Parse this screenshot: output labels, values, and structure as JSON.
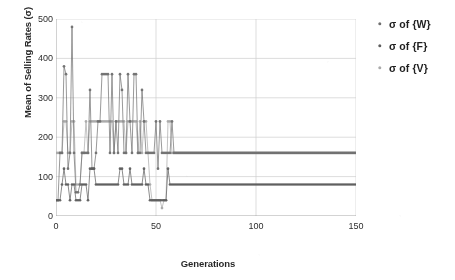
{
  "chart_data": {
    "type": "line",
    "title": "",
    "xlabel": "Generations",
    "ylabel": "Mean of Selling Rates (σ)",
    "xlim": [
      0,
      150
    ],
    "ylim": [
      0,
      500
    ],
    "xticks": [
      0,
      50,
      100,
      150
    ],
    "yticks": [
      0,
      100,
      200,
      300,
      400,
      500
    ],
    "grid": true,
    "legend_position": "right",
    "legend": [
      "σ of {W}",
      "σ of {F}",
      "σ of {V}"
    ],
    "colors": {
      "series_W": "#6b6b6b",
      "series_F": "#585858",
      "series_V": "#a8a8a8",
      "axis": "#9a9a9a",
      "grid": "#cfcfcf",
      "text": "#1c1c1c"
    },
    "annotations": [
      "All three series oscillate sharply for the first ~58 generations, then converge to constant plateaus.",
      "Converged upper plateau ≈ 160",
      "Converged lower plateau ≈ 80",
      "Global maximum ≈ 480 at generation 8"
    ],
    "x": [
      0,
      1,
      2,
      3,
      4,
      5,
      6,
      7,
      8,
      9,
      10,
      11,
      12,
      13,
      14,
      15,
      16,
      17,
      18,
      19,
      20,
      21,
      22,
      23,
      24,
      25,
      26,
      27,
      28,
      29,
      30,
      31,
      32,
      33,
      34,
      35,
      36,
      37,
      38,
      39,
      40,
      41,
      42,
      43,
      44,
      45,
      46,
      47,
      48,
      49,
      50,
      51,
      52,
      53,
      54,
      55,
      56,
      57,
      58,
      59,
      60,
      65,
      70,
      75,
      80,
      85,
      90,
      95,
      100,
      105,
      110,
      115,
      120,
      125,
      130,
      135,
      140,
      145,
      150
    ],
    "series": [
      {
        "name": "σ of {W}",
        "color": "#6b6b6b",
        "values": [
          40,
          40,
          160,
          160,
          380,
          360,
          120,
          160,
          480,
          160,
          60,
          60,
          80,
          160,
          160,
          160,
          160,
          320,
          120,
          120,
          160,
          240,
          240,
          360,
          360,
          360,
          360,
          160,
          360,
          160,
          240,
          160,
          360,
          320,
          160,
          160,
          360,
          240,
          160,
          360,
          360,
          160,
          160,
          320,
          240,
          160,
          160,
          160,
          160,
          160,
          240,
          120,
          240,
          160,
          160,
          160,
          160,
          160,
          240,
          160,
          160,
          160,
          160,
          160,
          160,
          160,
          160,
          160,
          160,
          160,
          160,
          160,
          160,
          160,
          160,
          160,
          160,
          160,
          160
        ]
      },
      {
        "name": "σ of {F}",
        "color": "#585858",
        "values": [
          40,
          40,
          40,
          80,
          120,
          80,
          80,
          40,
          80,
          80,
          40,
          40,
          40,
          80,
          80,
          80,
          40,
          120,
          120,
          120,
          80,
          80,
          80,
          80,
          80,
          80,
          80,
          80,
          80,
          80,
          80,
          80,
          120,
          120,
          80,
          80,
          80,
          120,
          80,
          80,
          80,
          80,
          80,
          80,
          120,
          80,
          80,
          40,
          40,
          40,
          40,
          40,
          40,
          40,
          40,
          40,
          120,
          80,
          80,
          80,
          80,
          80,
          80,
          80,
          80,
          80,
          80,
          80,
          80,
          80,
          80,
          80,
          80,
          80,
          80,
          80,
          80,
          80,
          80
        ]
      },
      {
        "name": "σ of {V}",
        "color": "#a8a8a8",
        "values": [
          160,
          160,
          160,
          160,
          240,
          240,
          160,
          160,
          240,
          240,
          80,
          80,
          80,
          160,
          160,
          240,
          160,
          240,
          240,
          240,
          240,
          240,
          240,
          240,
          240,
          240,
          240,
          240,
          240,
          160,
          240,
          240,
          240,
          240,
          240,
          160,
          240,
          240,
          240,
          240,
          240,
          160,
          240,
          160,
          240,
          240,
          160,
          80,
          40,
          40,
          40,
          40,
          40,
          20,
          40,
          40,
          240,
          240,
          160,
          160,
          160,
          160,
          160,
          160,
          160,
          160,
          160,
          160,
          160,
          160,
          160,
          160,
          160,
          160,
          160,
          160,
          160,
          160,
          160
        ]
      }
    ]
  },
  "axis_titles": {
    "y": "Mean of Selling Rates (σ)",
    "x": "Generations"
  },
  "legend": {
    "items": [
      {
        "label": "σ of {W}",
        "color": "#6b6b6b"
      },
      {
        "label": "σ of {F}",
        "color": "#585858"
      },
      {
        "label": "σ of {V}",
        "color": "#a8a8a8"
      }
    ]
  }
}
